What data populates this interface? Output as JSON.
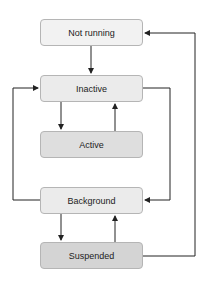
{
  "diagram": {
    "states": [
      {
        "id": "not_running",
        "label": "Not running",
        "fill": "#f2f2f2"
      },
      {
        "id": "inactive",
        "label": "Inactive",
        "fill": "#ebebeb"
      },
      {
        "id": "active",
        "label": "Active",
        "fill": "#dedede"
      },
      {
        "id": "background",
        "label": "Background",
        "fill": "#ebebeb"
      },
      {
        "id": "suspended",
        "label": "Suspended",
        "fill": "#d4d4d4"
      }
    ],
    "transitions": [
      {
        "from": "not_running",
        "to": "inactive"
      },
      {
        "from": "inactive",
        "to": "active"
      },
      {
        "from": "active",
        "to": "inactive"
      },
      {
        "from": "inactive",
        "to": "background"
      },
      {
        "from": "background",
        "to": "inactive"
      },
      {
        "from": "background",
        "to": "suspended"
      },
      {
        "from": "suspended",
        "to": "background"
      },
      {
        "from": "suspended",
        "to": "not_running"
      }
    ],
    "colors": {
      "line": "#222222",
      "border": "#b5b5b5"
    }
  }
}
